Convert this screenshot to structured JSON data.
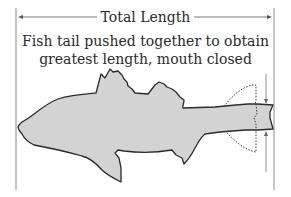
{
  "diagram": {
    "title": "Total Length",
    "caption_line1": "Fish tail pushed together to obtain",
    "caption_line2": "greatest length, mouth closed",
    "colors": {
      "fish_fill": "#d3d3d3",
      "fish_outline": "#2b2b2b",
      "measure_lines": "#8a8a8a",
      "dotted_tail": "#3a3a3a",
      "text": "#2a2a2a"
    },
    "elements": [
      "left-boundary-line",
      "right-boundary-line",
      "total-length-arrow",
      "fish-silhouette",
      "spread-tail-dotted-outline",
      "compressed-tail-indicator"
    ]
  }
}
